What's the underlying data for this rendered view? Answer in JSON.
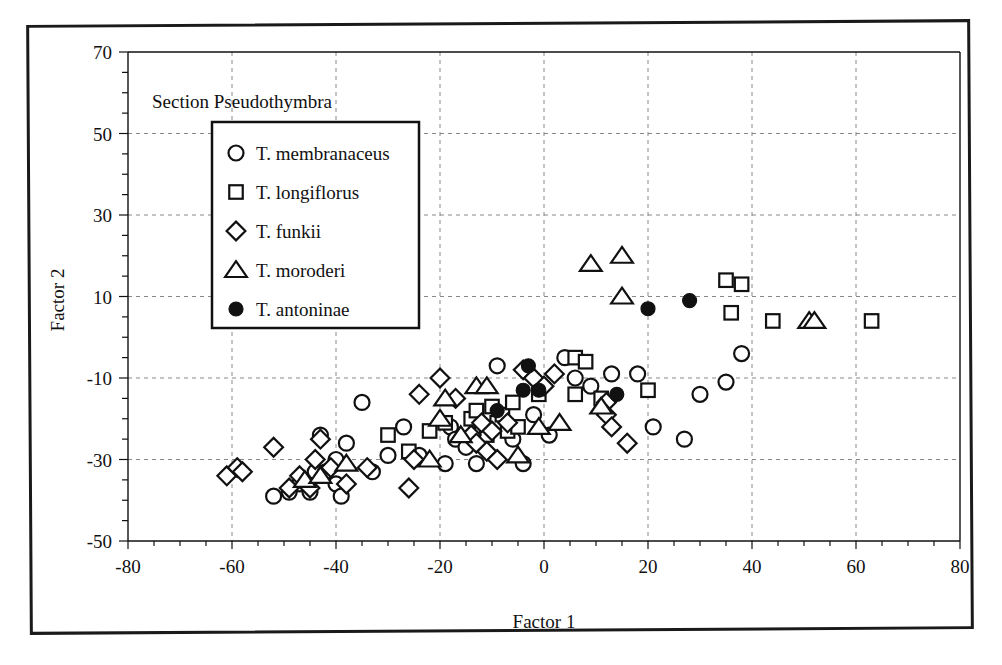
{
  "figure": {
    "section_title": "Section Pseudothymbra"
  },
  "chart_data": {
    "type": "scatter",
    "title": "Section Pseudothymbra",
    "xlabel": "Factor 1",
    "ylabel": "Factor 2",
    "xlim": [
      -80,
      80
    ],
    "ylim": [
      -50,
      70
    ],
    "xticks": [
      -80,
      -60,
      -40,
      -20,
      0,
      20,
      40,
      60,
      80
    ],
    "xtick_labels": [
      "-80",
      "-60",
      "-40",
      "-20",
      "0",
      "20",
      "40",
      "60",
      "80"
    ],
    "yticks": [
      -50,
      -30,
      -10,
      10,
      30,
      50,
      70
    ],
    "ytick_labels": [
      "-50",
      "-30",
      "-10",
      "10",
      "30",
      "50",
      "70"
    ],
    "minor_tick_step": 5,
    "grid": true,
    "grid_style": "dashed",
    "legend_position": "upper-left-inside",
    "series": [
      {
        "name": "T. membranaceus",
        "marker": "circle-open",
        "points": [
          [
            -52,
            -39
          ],
          [
            -49,
            -38
          ],
          [
            -47,
            -36
          ],
          [
            -45,
            -38
          ],
          [
            -44,
            -33
          ],
          [
            -43,
            -24
          ],
          [
            -42,
            -33
          ],
          [
            -40,
            -36
          ],
          [
            -40,
            -30
          ],
          [
            -39,
            -39
          ],
          [
            -38,
            -26
          ],
          [
            -35,
            -16
          ],
          [
            -33,
            -33
          ],
          [
            -30,
            -29
          ],
          [
            -27,
            -22
          ],
          [
            -24,
            -29
          ],
          [
            -19,
            -31
          ],
          [
            -18,
            -22
          ],
          [
            -17,
            -25
          ],
          [
            -15,
            -27
          ],
          [
            -13,
            -31
          ],
          [
            -9,
            -7
          ],
          [
            -8,
            -20
          ],
          [
            -6,
            -25
          ],
          [
            -4,
            -31
          ],
          [
            -2,
            -19
          ],
          [
            1,
            -24
          ],
          [
            4,
            -5
          ],
          [
            6,
            -10
          ],
          [
            9,
            -12
          ],
          [
            13,
            -9
          ],
          [
            18,
            -9
          ],
          [
            21,
            -22
          ],
          [
            27,
            -25
          ],
          [
            30,
            -14
          ],
          [
            35,
            -11
          ],
          [
            38,
            -4
          ]
        ]
      },
      {
        "name": "T. longiflorus",
        "marker": "square-open",
        "points": [
          [
            -30,
            -24
          ],
          [
            -26,
            -28
          ],
          [
            -22,
            -23
          ],
          [
            -19,
            -21
          ],
          [
            -14,
            -20
          ],
          [
            -13,
            -18
          ],
          [
            -12,
            -22
          ],
          [
            -11,
            -24
          ],
          [
            -10,
            -17
          ],
          [
            -9,
            -21
          ],
          [
            -8,
            -19
          ],
          [
            -7,
            -23
          ],
          [
            -6,
            -16
          ],
          [
            -5,
            -22
          ],
          [
            -1,
            -14
          ],
          [
            6,
            -5
          ],
          [
            8,
            -6
          ],
          [
            6,
            -14
          ],
          [
            11,
            -15
          ],
          [
            20,
            -13
          ],
          [
            35,
            14
          ],
          [
            38,
            13
          ],
          [
            36,
            6
          ],
          [
            44,
            4
          ],
          [
            63,
            4
          ]
        ]
      },
      {
        "name": "T. funkii",
        "marker": "diamond-open",
        "points": [
          [
            -61,
            -34
          ],
          [
            -59,
            -32
          ],
          [
            -58,
            -33
          ],
          [
            -52,
            -27
          ],
          [
            -49,
            -37
          ],
          [
            -47,
            -34
          ],
          [
            -45,
            -37
          ],
          [
            -44,
            -30
          ],
          [
            -43,
            -25
          ],
          [
            -41,
            -32
          ],
          [
            -38,
            -36
          ],
          [
            -34,
            -32
          ],
          [
            -26,
            -37
          ],
          [
            -25,
            -30
          ],
          [
            -24,
            -14
          ],
          [
            -20,
            -10
          ],
          [
            -17,
            -15
          ],
          [
            -14,
            -24
          ],
          [
            -13,
            -26
          ],
          [
            -12,
            -21
          ],
          [
            -11,
            -28
          ],
          [
            -10,
            -23
          ],
          [
            -9,
            -30
          ],
          [
            -7,
            -21
          ],
          [
            -4,
            -8
          ],
          [
            -2,
            -10
          ],
          [
            0,
            -12
          ],
          [
            2,
            -9
          ],
          [
            12,
            -16
          ],
          [
            12,
            -19
          ],
          [
            13,
            -22
          ],
          [
            16,
            -26
          ]
        ]
      },
      {
        "name": "T. moroderi",
        "marker": "triangle-open",
        "points": [
          [
            -46,
            -35
          ],
          [
            -43,
            -34
          ],
          [
            -38,
            -31
          ],
          [
            -22,
            -30
          ],
          [
            -20,
            -20
          ],
          [
            -19,
            -15
          ],
          [
            -16,
            -24
          ],
          [
            -13,
            -12
          ],
          [
            -11,
            -12
          ],
          [
            -5,
            -29
          ],
          [
            -1,
            -22
          ],
          [
            3,
            -21
          ],
          [
            9,
            18
          ],
          [
            15,
            20
          ],
          [
            15,
            10
          ],
          [
            11,
            -17
          ],
          [
            51,
            4
          ],
          [
            52,
            4
          ]
        ]
      },
      {
        "name": "T. antoninae",
        "marker": "circle-filled",
        "points": [
          [
            -3,
            -7
          ],
          [
            -1,
            -13
          ],
          [
            -9,
            -18
          ],
          [
            -4,
            -13
          ],
          [
            14,
            -14
          ],
          [
            20,
            7
          ],
          [
            28,
            9
          ]
        ]
      }
    ]
  },
  "legend": {
    "entries": [
      {
        "marker": "circle-open",
        "label": "T. membranaceus"
      },
      {
        "marker": "square-open",
        "label": "T. longiflorus"
      },
      {
        "marker": "diamond-open",
        "label": "T. funkii"
      },
      {
        "marker": "triangle-open",
        "label": "T. moroderi"
      },
      {
        "marker": "circle-filled",
        "label": "T. antoninae"
      }
    ]
  },
  "colors": {
    "ink": "#111111",
    "grid": "#888888",
    "frame": "#1a1a1a",
    "marker_fill": "#ffffff",
    "marker_stroke": "#111111"
  }
}
